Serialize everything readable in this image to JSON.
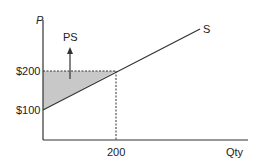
{
  "diagram": {
    "y_axis_label": "P",
    "x_axis_label": "Qty",
    "price_labels": [
      "$200",
      "$100"
    ],
    "quantity_label": "200",
    "curve_label": "S",
    "area_label": "PS",
    "colors": {
      "line": "#333333",
      "shade": "#c8c8c8"
    }
  }
}
